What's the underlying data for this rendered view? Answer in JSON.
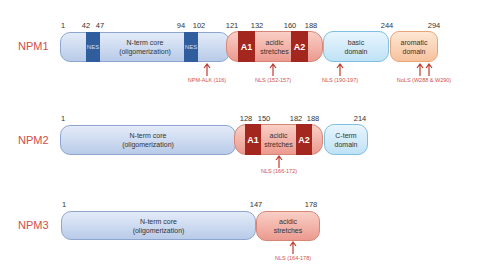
{
  "proteins": [
    {
      "name": "NPM1",
      "positions": [
        "1",
        "42",
        "47",
        "94",
        "102",
        "121",
        "132",
        "160",
        "188",
        "244",
        "294"
      ],
      "domains": {
        "nterm": {
          "line1": "N-term core",
          "line2": "(oligomerization)"
        },
        "nes": [
          "NES",
          "NES"
        ],
        "acidic": {
          "line1": "acidic",
          "line2": "stretches",
          "a1": "A1",
          "a2": "A2"
        },
        "basic": {
          "line1": "basic",
          "line2": "domain"
        },
        "aromatic": {
          "line1": "aromatic",
          "line2": "domain"
        }
      },
      "annotations": [
        "NPM-ALK (116)",
        "NLS (152-157)",
        "NLS (190-197)",
        "NoLS (W288 & W290)"
      ]
    },
    {
      "name": "NPM2",
      "positions": [
        "1",
        "128",
        "150",
        "182",
        "188",
        "214"
      ],
      "domains": {
        "nterm": {
          "line1": "N-term core",
          "line2": "(oligomerization)"
        },
        "acidic": {
          "line1": "acidic",
          "line2": "stretches",
          "a1": "A1",
          "a2": "A2"
        },
        "cterm": {
          "line1": "C-term",
          "line2": "domain"
        }
      },
      "annotations": [
        "NLS (166-172)"
      ]
    },
    {
      "name": "NPM3",
      "positions": [
        "1",
        "147",
        "178"
      ],
      "domains": {
        "nterm": {
          "line1": "N-term core",
          "line2": "(oligomerization)"
        },
        "acidic": {
          "line1": "acidic",
          "line2": "stretches"
        }
      },
      "annotations": [
        "NLS (164-178)"
      ]
    }
  ],
  "colors": {
    "label": "#d0504a",
    "nes": "#2f5d9e",
    "acid_box": "#a3271e",
    "arrow": "#c0392b"
  }
}
